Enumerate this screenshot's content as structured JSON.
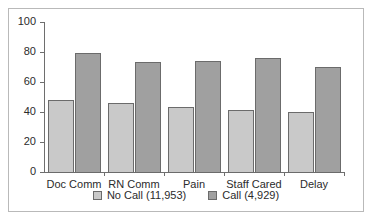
{
  "chart_data": {
    "type": "bar",
    "title": "",
    "subtitle": "",
    "xlabel": "",
    "ylabel": "",
    "ylim": [
      0,
      100
    ],
    "yticks": [
      0,
      20,
      40,
      60,
      80,
      100
    ],
    "ytick_labels": [
      "0",
      "20",
      "40",
      "60",
      "80",
      "100"
    ],
    "grid": false,
    "legend_position": "bottom",
    "categories": [
      "Doc Comm",
      "RN Comm",
      "Pain",
      "Staff Cared",
      "Delay"
    ],
    "series": [
      {
        "name": "No Call (11,953)",
        "color": "#c9c9c9",
        "values": [
          49,
          47,
          44,
          42,
          41
        ]
      },
      {
        "name": "Call (4,929)",
        "color": "#a0a0a0",
        "values": [
          80,
          74,
          75,
          77,
          71
        ]
      }
    ]
  },
  "legend": {
    "items": [
      {
        "label": "No Call (11,953)"
      },
      {
        "label": "Call (4,929)"
      }
    ]
  },
  "colors": {
    "series_no_call": "#c9c9c9",
    "series_call": "#a0a0a0",
    "axis": "#6e6e6e",
    "frame": "#b9b9b9",
    "text": "#2b2b2b",
    "background": "#ffffff"
  }
}
